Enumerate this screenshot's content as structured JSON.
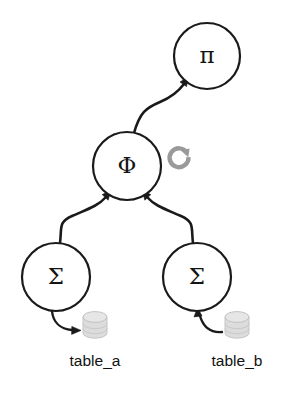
{
  "diagram": {
    "background_color": "#ffffff",
    "stroke_color": "#1a1a1a",
    "cylinder_color": "#dcdcdc",
    "refresh_icon_color": "#9a9a9a",
    "nodes": [
      {
        "id": "projection",
        "glyph": "π",
        "name": "pi",
        "role": "projection-operator",
        "cx": 207,
        "cy": 56,
        "r": 33
      },
      {
        "id": "join",
        "glyph": "Φ",
        "name": "phi",
        "role": "join-operator",
        "cx": 127,
        "cy": 166,
        "r": 34
      },
      {
        "id": "scan-left",
        "glyph": "Σ",
        "name": "sigma-left",
        "role": "scan-operator",
        "cx": 56,
        "cy": 277,
        "r": 34
      },
      {
        "id": "scan-right",
        "glyph": "Σ",
        "name": "sigma-right",
        "role": "scan-operator",
        "cx": 197,
        "cy": 277,
        "r": 34
      }
    ],
    "tables": [
      {
        "id": "table-a",
        "label": "table_a",
        "cx": 95,
        "cy": 325,
        "label_x": 95,
        "label_y": 362
      },
      {
        "id": "table-b",
        "label": "table_b",
        "cx": 237,
        "cy": 325,
        "label_x": 237,
        "label_y": 362
      }
    ],
    "edges": [
      {
        "id": "phi-to-pi",
        "from": "join",
        "to": "projection",
        "direction": "up"
      },
      {
        "id": "sigma-left-to-phi",
        "from": "scan-left",
        "to": "join",
        "direction": "up-right"
      },
      {
        "id": "sigma-right-to-phi",
        "from": "scan-right",
        "to": "join",
        "direction": "up-left"
      },
      {
        "id": "sigma-left-to-table-a",
        "from": "scan-left",
        "to": "table-a",
        "direction": "down-right"
      },
      {
        "id": "table-b-to-sigma-right",
        "from": "table-b",
        "to": "scan-right",
        "direction": "up-left"
      }
    ],
    "refresh_icon": {
      "name": "refresh-icon",
      "cx": 181,
      "cy": 160,
      "r": 9.5
    }
  }
}
